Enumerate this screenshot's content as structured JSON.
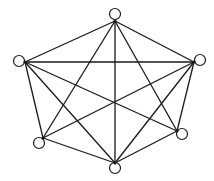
{
  "diagram": {
    "type": "complete-graph",
    "title": "",
    "stroke_color": "#1a1a1a",
    "node_fill": "#ffffff",
    "node_radius": 5.5,
    "nodes": [
      {
        "id": "top",
        "cx": 115,
        "cy": 14,
        "ax": 115,
        "ay": 21
      },
      {
        "id": "left",
        "cx": 19,
        "cy": 61,
        "ax": 25,
        "ay": 62
      },
      {
        "id": "right",
        "cx": 200,
        "cy": 60,
        "ax": 194,
        "ay": 62
      },
      {
        "id": "bottom-left",
        "cx": 39,
        "cy": 143,
        "ax": 43,
        "ay": 138
      },
      {
        "id": "bottom-right",
        "cx": 182,
        "cy": 134,
        "ax": 177,
        "ay": 131
      },
      {
        "id": "bottom",
        "cx": 115,
        "cy": 168,
        "ax": 115,
        "ay": 163
      }
    ],
    "edges": [
      [
        "top",
        "left"
      ],
      [
        "top",
        "right"
      ],
      [
        "top",
        "bottom-left"
      ],
      [
        "top",
        "bottom-right"
      ],
      [
        "top",
        "bottom"
      ],
      [
        "left",
        "right"
      ],
      [
        "left",
        "bottom-left"
      ],
      [
        "left",
        "bottom-right"
      ],
      [
        "left",
        "bottom"
      ],
      [
        "right",
        "bottom-left"
      ],
      [
        "right",
        "bottom-right"
      ],
      [
        "right",
        "bottom"
      ],
      [
        "bottom-left",
        "bottom"
      ],
      [
        "bottom-right",
        "bottom"
      ]
    ]
  }
}
